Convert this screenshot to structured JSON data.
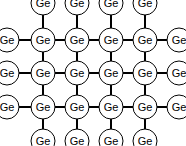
{
  "diagram": {
    "atom_label": "Ge",
    "columns_x": [
      7,
      43,
      77,
      111,
      145,
      179
    ],
    "rows_y": [
      3,
      40,
      73,
      107,
      141
    ],
    "atom_radius": 12,
    "colors": {
      "line": "#000000",
      "background": "#ffffff",
      "atom_fill": "#ffffff"
    }
  }
}
